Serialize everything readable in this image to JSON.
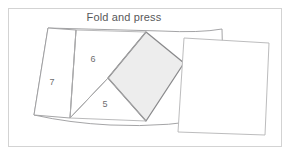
{
  "figure": {
    "caption": "Fold and press",
    "caption_position": {
      "x": 124,
      "y": 21
    },
    "frame": {
      "stroke": "#d3d3d3",
      "x": 8,
      "y": 8,
      "width": 274,
      "height": 139,
      "background": "#ffffff"
    },
    "colors": {
      "outline": "#9a9a9c",
      "fold_line": "#a8a8aa",
      "shaded_fill": "#ededed",
      "shaded_outline": "#8a8a8c",
      "sheet_fill": "#ffffff",
      "sheet_outline": "#b4b4b6",
      "caption_text": "#58585a",
      "number_text": "#6e6e70",
      "page_background": "#ffffff"
    },
    "folded_sheet": {
      "name": "folded-paper-body",
      "path": "M 48 28 L 161 31 Q 200 33 222 29 L 224 116 Q 170 128 110 125 Q 70 123 34 115 Z",
      "fill": "#ffffff"
    },
    "panels": [
      {
        "id": "panel-7",
        "label": "7",
        "label_x": 52,
        "label_y": 85,
        "path": "M 48 28 L 76 30 L 70 118 L 34 115 Z",
        "fill": "#ffffff"
      },
      {
        "id": "panel-6",
        "label": "6",
        "label_x": 93,
        "label_y": 62,
        "path": "M 76 30 L 146 32 L 108 78 L 70 118 Z",
        "fill": "#ffffff"
      },
      {
        "id": "panel-5",
        "label": "5",
        "label_x": 105,
        "label_y": 107,
        "path": "M 108 78 L 146 121 L 70 118 Z",
        "fill": "#ffffff"
      }
    ],
    "shaded_flap": {
      "id": "shaded-square-flap",
      "path": "M 146 32 L 184 63 L 146 121 L 108 78 Z",
      "fill": "#ededed",
      "stroke": "#8a8a8c"
    },
    "top_sheet": {
      "id": "top-white-sheet",
      "path": "M 184 38 L 269 43 L 265 135 L 178 132 Z",
      "fill": "#ffffff",
      "stroke": "#b4b4b6"
    },
    "fold_lines": [
      {
        "id": "fold-line-7-6",
        "path": "M 76 30 L 70 118"
      },
      {
        "id": "fold-line-6-5",
        "path": "M 146 32 L 108 78 L 70 118"
      },
      {
        "id": "fold-line-5-flap",
        "path": "M 108 78 L 146 121"
      },
      {
        "id": "fold-line-flap-right",
        "path": "M 184 63 L 222 58"
      }
    ]
  }
}
